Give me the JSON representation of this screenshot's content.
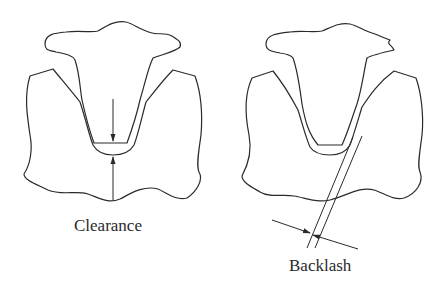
{
  "figure": {
    "panels": [
      {
        "id": "clearance",
        "label": "Clearance"
      },
      {
        "id": "backlash",
        "label": "Backlash"
      }
    ],
    "colors": {
      "stroke": "#2a2a2a",
      "background": "#ffffff"
    }
  }
}
